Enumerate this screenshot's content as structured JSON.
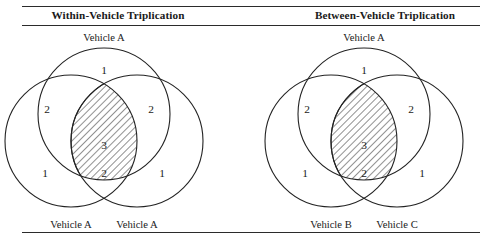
{
  "figure": {
    "background_color": "#ffffff",
    "line_color": "#232323",
    "rules": [
      "rule-top",
      "rule-under-heading",
      "rule-bottom"
    ]
  },
  "panels": [
    {
      "id": "within-vehicle",
      "title": "Within-Vehicle Triplication",
      "top_label": "Vehicle A",
      "bottom_left_label": "Vehicle A",
      "bottom_right_label": "Vehicle A",
      "regions": {
        "top_only": "1",
        "top_left_pair": "2",
        "top_right_pair": "2",
        "bottom_left_only": "1",
        "bottom_right_only": "1",
        "bottom_pair": "2",
        "center_triple": "3"
      }
    },
    {
      "id": "between-vehicle",
      "title": "Between-Vehicle Triplication",
      "top_label": "Vehicle A",
      "bottom_left_label": "Vehicle B",
      "bottom_right_label": "Vehicle C",
      "regions": {
        "top_only": "1",
        "top_left_pair": "2",
        "top_right_pair": "2",
        "bottom_left_only": "1",
        "bottom_right_only": "1",
        "bottom_pair": "2",
        "center_triple": "3"
      }
    }
  ]
}
